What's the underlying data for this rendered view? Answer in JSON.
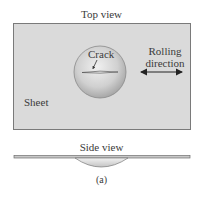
{
  "figure": {
    "top_view": {
      "title": "Top view",
      "sheet_label": "Sheet",
      "crack_label": "Crack",
      "rolling_direction_line1": "Rolling",
      "rolling_direction_line2": "direction",
      "arrow": "double-headed-arrow"
    },
    "side_view": {
      "title": "Side view"
    },
    "caption": "(a)",
    "colors": {
      "sheet_fill": "#d9d9d9",
      "sheet_border": "#7a7a7a",
      "circle_light": "#efefef",
      "circle_dark": "#a9a9a9",
      "text": "#3a3a3a"
    }
  }
}
